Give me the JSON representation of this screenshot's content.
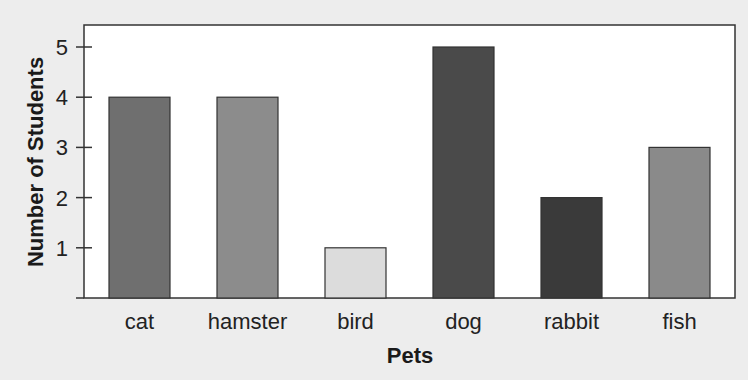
{
  "chart_data": {
    "type": "bar",
    "title": "",
    "xlabel": "Pets",
    "ylabel": "Number of Students",
    "categories": [
      "cat",
      "hamster",
      "bird",
      "dog",
      "rabbit",
      "fish"
    ],
    "values": [
      4,
      4,
      1,
      5,
      2,
      3
    ],
    "bar_colors": [
      "#6f6f6f",
      "#8c8c8c",
      "#dcdcdc",
      "#4a4a4a",
      "#3a3a3a",
      "#8a8a8a"
    ],
    "ylim": [
      0,
      5.5
    ],
    "yticks": [
      1,
      2,
      3,
      4,
      5
    ],
    "grid": false,
    "legend": null
  },
  "colors": {
    "background": "#ededed",
    "plot_background": "#ffffff",
    "axis": "#333333"
  }
}
